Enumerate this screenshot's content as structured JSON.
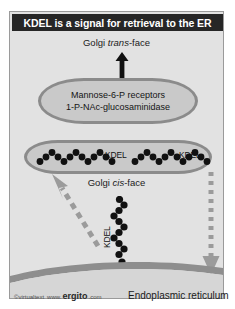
{
  "figure": {
    "title": "KDEL is a signal for retrieval to the ER",
    "colors": {
      "panel_background": "#e2e2e2",
      "title_background": "#262626",
      "title_text": "#ffffff",
      "cisterna_fill": "#c9c9c9",
      "cisterna_border": "#8b8b8b",
      "bead": "#111111",
      "dashed_arrow": "#9b9b9b",
      "solid_arrow": "#111111",
      "er_membrane": "#8e8e8e"
    }
  },
  "labels": {
    "golgi_trans": {
      "prefix": "Golgi ",
      "italic": "trans",
      "suffix": "-face"
    },
    "golgi_cis": {
      "prefix": "Golgi ",
      "italic": "cis",
      "suffix": "-face"
    },
    "endoplasmic_reticulum": "Endoplasmic reticulum"
  },
  "cisterna_trans": {
    "line1": "Mannose-6-P  receptors",
    "line2": "1-P-NAc-glucosaminidase"
  },
  "cisterna_cis": {
    "kdel_left": "KDEL",
    "kdel_right": "KDEL",
    "beads_per_chain": 13
  },
  "transport": {
    "kdel_vertical": "KDEL",
    "vertical_beads": 12
  },
  "watermark": {
    "copyright": "©virtualtext",
    "www": "www.",
    "brand": "ergito",
    "tld": ".com"
  }
}
